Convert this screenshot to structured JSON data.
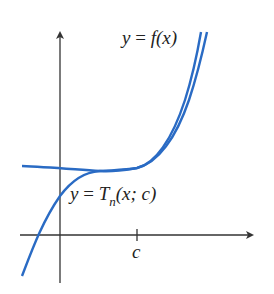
{
  "diagram": {
    "colors": {
      "curve": "#2a6bc4",
      "axis": "#333333",
      "text": "#222222"
    },
    "labels": {
      "f_curve": {
        "lhs": "y",
        "eq": "=",
        "func": "f",
        "arg": "(x)"
      },
      "taylor_curve": {
        "lhs": "y",
        "eq": "=",
        "func": "T",
        "subscript": "n",
        "arg": "(x; c)"
      },
      "x_tick": "c"
    },
    "axes": {
      "x_axis": "horizontal axis with arrow",
      "y_axis": "vertical axis with arrow",
      "ticks": [
        "c"
      ]
    },
    "curves": [
      {
        "name": "y = f(x)",
        "description": "rising function curve"
      },
      {
        "name": "y = T_n(x; c)",
        "description": "Taylor polynomial tangent to f near c"
      }
    ]
  }
}
